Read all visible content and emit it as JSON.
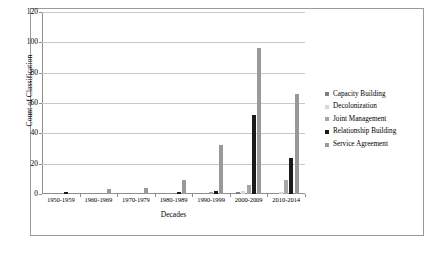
{
  "chart_data": {
    "type": "bar",
    "title": "",
    "xlabel": "Decades",
    "ylabel": "Count of Classification",
    "categories": [
      "1950-1959",
      "1960-1969",
      "1970-1979",
      "1980-1989",
      "1990-1999",
      "2000-2009",
      "2010-2014"
    ],
    "ylim": [
      0,
      120
    ],
    "ytick_labels": [
      "0",
      "20",
      "40",
      "60",
      "80",
      "100",
      "120"
    ],
    "ytick_values": [
      0,
      20,
      40,
      60,
      80,
      100,
      120
    ],
    "grid": true,
    "legend_position": "right",
    "series": [
      {
        "name": "Capacity Building",
        "color": "#808080",
        "values": [
          0,
          0,
          0,
          0,
          0,
          1,
          0
        ]
      },
      {
        "name": "Decolonization",
        "color": "#d9d9d9",
        "values": [
          0,
          0,
          0,
          0,
          0,
          2,
          1
        ]
      },
      {
        "name": "Joint Management",
        "color": "#a6a6a6",
        "values": [
          0,
          0,
          0,
          0,
          1,
          6,
          9
        ]
      },
      {
        "name": "Relationship Building",
        "color": "#1a1a1a",
        "values": [
          1,
          0,
          0,
          1,
          2,
          52,
          24
        ]
      },
      {
        "name": "Service Agreement",
        "color": "#999999",
        "values": [
          0,
          3,
          4,
          9,
          32,
          96,
          66
        ]
      }
    ]
  }
}
